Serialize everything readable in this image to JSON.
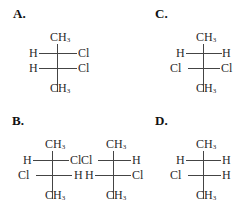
{
  "options": [
    {
      "id": "A",
      "label": "A.",
      "projections": [
        {
          "top": "CH3",
          "rows": [
            {
              "left": "H",
              "right": "Cl"
            },
            {
              "left": "H",
              "right": "Cl"
            }
          ],
          "bottom": "CH3"
        }
      ]
    },
    {
      "id": "B",
      "label": "B.",
      "projections": [
        {
          "top": "CH3",
          "rows": [
            {
              "left": "H",
              "right": "Cl"
            },
            {
              "left": "Cl",
              "right": "H"
            }
          ],
          "bottom": "CH3"
        },
        {
          "top": "CH3",
          "rows": [
            {
              "left": "Cl",
              "right": "H"
            },
            {
              "left": "H",
              "right": "Cl"
            }
          ],
          "bottom": "CH3"
        }
      ]
    },
    {
      "id": "C",
      "label": "C.",
      "projections": [
        {
          "top": "CH3",
          "rows": [
            {
              "left": "H",
              "right": "H"
            },
            {
              "left": "Cl",
              "right": "Cl"
            }
          ],
          "bottom": "CH3"
        }
      ]
    },
    {
      "id": "D",
      "label": "D.",
      "projections": [
        {
          "top": "CH3",
          "rows": [
            {
              "left": "H",
              "right": "H"
            },
            {
              "left": "Cl",
              "right": "H"
            }
          ],
          "bottom": "CH3"
        }
      ]
    }
  ]
}
